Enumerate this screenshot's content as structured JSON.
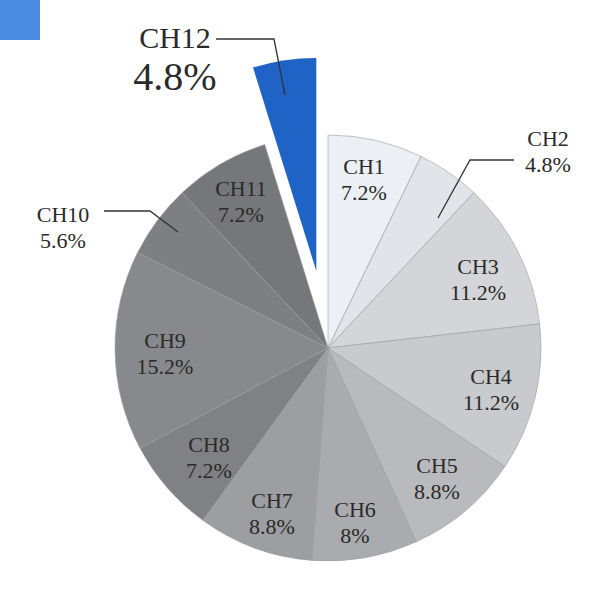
{
  "chart_data": {
    "type": "pie",
    "title": "",
    "start_angle_deg": 0,
    "direction": "clockwise",
    "exploded": [
      "CH12"
    ],
    "categories": [
      "CH1",
      "CH2",
      "CH3",
      "CH4",
      "CH5",
      "CH6",
      "CH7",
      "CH8",
      "CH9",
      "CH10",
      "CH11",
      "CH12"
    ],
    "values": [
      7.2,
      4.8,
      11.2,
      11.2,
      8.8,
      8,
      8.8,
      7.2,
      15.2,
      5.6,
      7.2,
      4.8
    ],
    "labels": [
      "7.2%",
      "4.8%",
      "11.2%",
      "11.2%",
      "8.8%",
      "8%",
      "8.8%",
      "7.2%",
      "15.2%",
      "5.6%",
      "7.2%",
      "4.8%"
    ],
    "colors": [
      "#eceff3",
      "#e1e4e8",
      "#d3d5d8",
      "#c8cacd",
      "#b8babd",
      "#a9abae",
      "#9c9ea1",
      "#7f8184",
      "#88898c",
      "#7d7f82",
      "#75777a",
      "#1f63c6"
    ],
    "callouts": [
      "CH2",
      "CH10",
      "CH12"
    ]
  },
  "decor": {
    "corner_swatch_color": "#4a8ae0"
  }
}
